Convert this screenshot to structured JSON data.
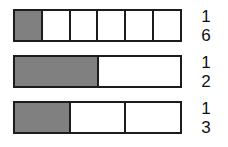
{
  "diagram": {
    "background_color": "#ffffff",
    "shade_color": "#808080",
    "border_color": "#1c1c1c",
    "text_color": "#111111"
  },
  "chart_data": {
    "type": "bar",
    "title": "",
    "xlabel": "",
    "ylabel": "",
    "categories": [
      "1/6",
      "1/2",
      "1/3"
    ],
    "values": [
      0.16666667,
      0.5,
      0.33333333
    ],
    "series": [
      {
        "name": "shaded fraction of whole",
        "values": [
          0.16666667,
          0.5,
          0.33333333
        ]
      }
    ],
    "annotations": [
      "Each bar represents one whole unit of equal total length.",
      "Bar 1 is divided into 6 equal parts with 1 part shaded.",
      "Bar 2 is divided into 2 equal parts with 1 part shaded.",
      "Bar 3 is divided into 3 equal parts with 1 part shaded."
    ],
    "grid": false,
    "legend": false
  },
  "bars": [
    {
      "id": "bar-one-sixth",
      "denominator": 6,
      "numerator": 1,
      "shaded_cells": 1,
      "total_cells": 6,
      "cells": [
        {
          "shaded": true
        },
        {
          "shaded": false
        },
        {
          "shaded": false
        },
        {
          "shaded": false
        },
        {
          "shaded": false
        },
        {
          "shaded": false
        }
      ],
      "label": {
        "numerator": "1",
        "denominator": "6"
      }
    },
    {
      "id": "bar-one-half",
      "denominator": 2,
      "numerator": 1,
      "shaded_cells": 1,
      "total_cells": 2,
      "cells": [
        {
          "shaded": true
        },
        {
          "shaded": false
        }
      ],
      "label": {
        "numerator": "1",
        "denominator": "2"
      }
    },
    {
      "id": "bar-one-third",
      "denominator": 3,
      "numerator": 1,
      "shaded_cells": 1,
      "total_cells": 3,
      "cells": [
        {
          "shaded": true
        },
        {
          "shaded": false
        },
        {
          "shaded": false
        }
      ],
      "label": {
        "numerator": "1",
        "denominator": "3"
      }
    }
  ]
}
